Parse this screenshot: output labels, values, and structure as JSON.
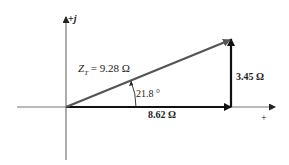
{
  "diagram": {
    "type": "impedance-phasor-diagram",
    "axes": {
      "imaginary_label_sign": "+",
      "imaginary_label_unit": "j",
      "real_label": "+"
    },
    "resultant": {
      "symbol": "Z",
      "subscript": "T",
      "equals": " = ",
      "value": "9.28 Ω"
    },
    "angle_label": "21.8 °",
    "real_component_label": "8.62 Ω",
    "imaginary_component_label": "3.45 Ω",
    "colors": {
      "axis": "#777777",
      "resultant": "#555555",
      "components": "#111111",
      "text": "#222222"
    }
  }
}
